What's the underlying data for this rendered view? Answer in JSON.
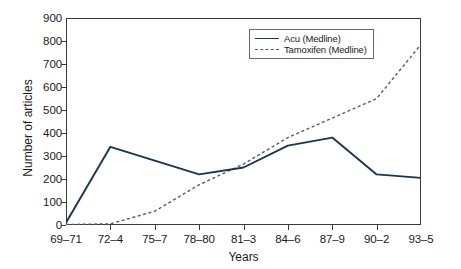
{
  "chart_data": {
    "type": "line",
    "title": "",
    "xlabel": "Years",
    "ylabel": "Number of articles",
    "categories": [
      "69–71",
      "72–4",
      "75–7",
      "78–80",
      "81–3",
      "84–6",
      "87–9",
      "90–2",
      "93–5"
    ],
    "ylim": [
      0,
      900
    ],
    "yticks": [
      0,
      100,
      200,
      300,
      400,
      500,
      600,
      700,
      800,
      900
    ],
    "ytick_labels": [
      "0",
      "100",
      "200",
      "300",
      "400",
      "500",
      "600",
      "700",
      "800",
      "900"
    ],
    "grid": false,
    "legend_position": "upper-right",
    "series": [
      {
        "name": "Acu (Medline)",
        "style": "solid",
        "color": "#1b3550",
        "values": [
          10,
          340,
          280,
          220,
          250,
          345,
          380,
          220,
          205
        ]
      },
      {
        "name": "Tamoxifen (Medline)",
        "style": "dashed",
        "color": "#5a5a5a",
        "values": [
          2,
          5,
          60,
          175,
          265,
          380,
          465,
          550,
          785
        ]
      }
    ]
  },
  "legend": {
    "items": [
      {
        "label": "Acu (Medline)",
        "swatch": "solid-line-swatch"
      },
      {
        "label": "Tamoxifen (Medline)",
        "swatch": "dashed-line-swatch"
      }
    ]
  },
  "axes": {
    "y_title": "Number of articles",
    "x_title": "Years"
  },
  "colors": {
    "axis": "#3a3a3a",
    "series_solid": "#1b3550",
    "series_dashed": "#5a5a5a",
    "legend_border": "#5d6f73",
    "background": "#ffffff"
  }
}
